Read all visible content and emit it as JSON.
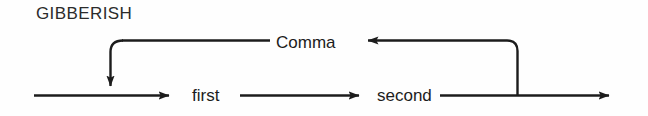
{
  "diagram": {
    "kind": "railroad-syntax-diagram",
    "title": "GIBBERISH",
    "background_color": "#fefefe",
    "line_color": "#1c1c1c",
    "text_color": "#1c1c1c",
    "nodes": [
      {
        "id": "first",
        "label": "first"
      },
      {
        "id": "second",
        "label": "second"
      },
      {
        "id": "comma",
        "label": "Comma"
      }
    ],
    "labels": {
      "title": "GIBBERISH",
      "first": "first",
      "second": "second",
      "comma": "Comma"
    },
    "edges": [
      {
        "from": "entry",
        "to": "first",
        "direction": "right"
      },
      {
        "from": "first",
        "to": "second",
        "direction": "right"
      },
      {
        "from": "second",
        "to": "exit",
        "direction": "right"
      },
      {
        "from": "second",
        "to": "comma",
        "direction": "left",
        "type": "feedback-loop"
      },
      {
        "from": "comma",
        "to": "first",
        "direction": "down",
        "type": "feedback-loop"
      }
    ]
  }
}
